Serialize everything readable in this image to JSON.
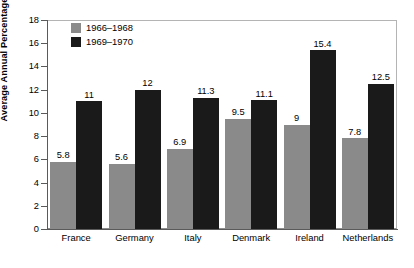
{
  "chart_data": {
    "type": "bar",
    "title": "",
    "xlabel": "",
    "ylabel": "Average Annual Percentage Change",
    "categories": [
      "France",
      "Germany",
      "Italy",
      "Denmark",
      "Ireland",
      "Netherlands"
    ],
    "series": [
      {
        "name": "1966–1968",
        "color": "#8a8a8a",
        "values": [
          5.8,
          5.6,
          6.9,
          9.5,
          9,
          7.8
        ],
        "labels": [
          "5.8",
          "5.6",
          "6.9",
          "9.5",
          "9",
          "7.8"
        ]
      },
      {
        "name": "1969–1970",
        "color": "#1a1a1a",
        "values": [
          11,
          12,
          11.3,
          11.1,
          15.4,
          12.5
        ],
        "labels": [
          "11",
          "12",
          "11.3",
          "11.1",
          "15.4",
          "12.5"
        ]
      }
    ],
    "ylim": [
      0,
      18
    ],
    "ytick_step": 2,
    "ytick_labels": [
      "0",
      "2",
      "4",
      "6",
      "8",
      "10",
      "12",
      "14",
      "16",
      "18"
    ],
    "grid": false,
    "legend_position": "top-left",
    "data_labels_shown": true
  },
  "colors": {
    "series_1966_1968": "#8a8a8a",
    "series_1969_1970": "#1a1a1a",
    "frame": "#b4b4b4",
    "axis": "#5a5a5a",
    "background": "#ffffff",
    "text": "#000000"
  }
}
